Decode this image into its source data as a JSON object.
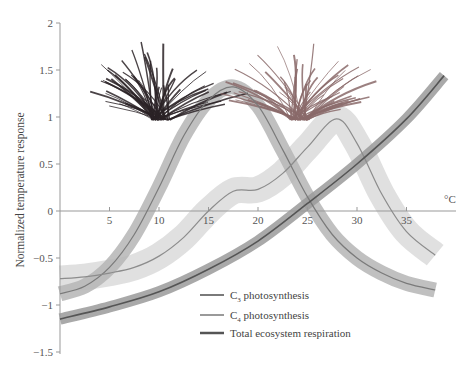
{
  "chart_data": {
    "type": "line",
    "title": "",
    "xlabel": "°C",
    "ylabel": "Normalized temperature response",
    "xlim": [
      0,
      40
    ],
    "ylim": [
      -1.5,
      2
    ],
    "xticks": [
      5,
      10,
      15,
      20,
      25,
      30,
      35
    ],
    "yticks": [
      -1.5,
      -1,
      -0.5,
      0,
      0.5,
      1,
      1.5,
      2
    ],
    "ytick_labels": [
      "−1.5",
      "−1",
      "−0.5",
      "0",
      "0.5",
      "1",
      "1.5",
      "2"
    ],
    "grid": false,
    "legend_position": "lower center",
    "series": [
      {
        "name": "C3 photosynthesis",
        "label_main": "C",
        "label_sub": "3",
        "label_rest": " photosynthesis",
        "color": "#7a7a7a",
        "band_color": "#b5b5b5",
        "band_halfwidth": 0.08,
        "x": [
          0,
          2.5,
          5,
          7.5,
          10,
          12.5,
          15,
          17.5,
          20,
          22.5,
          25,
          27.5,
          30,
          32.5,
          35,
          37.9
        ],
        "y": [
          -0.88,
          -0.8,
          -0.6,
          -0.25,
          0.25,
          0.8,
          1.18,
          1.32,
          1.12,
          0.65,
          0.15,
          -0.25,
          -0.5,
          -0.66,
          -0.77,
          -0.84
        ]
      },
      {
        "name": "C4 photosynthesis",
        "label_main": "C",
        "label_sub": "4",
        "label_rest": " photosynthesis",
        "color": "#8c8c8c",
        "band_color": "#d6d6d6",
        "band_halfwidth": 0.14,
        "x": [
          0,
          2.5,
          5,
          7.5,
          10,
          12.5,
          15,
          17.5,
          20,
          22.5,
          25,
          27.9,
          30,
          32.5,
          35,
          37.9
        ],
        "y": [
          -0.72,
          -0.7,
          -0.66,
          -0.6,
          -0.48,
          -0.28,
          0.0,
          0.21,
          0.23,
          0.4,
          0.68,
          0.98,
          0.72,
          0.18,
          -0.22,
          -0.47
        ]
      },
      {
        "name": "Total ecosystem respiration",
        "label_main": "Total ecosystem respiration",
        "label_sub": "",
        "label_rest": "",
        "color": "#555555",
        "band_color": "#9a9a9a",
        "band_halfwidth": 0.06,
        "x": [
          0,
          5,
          10,
          15,
          20,
          25,
          30,
          35,
          38.8
        ],
        "y": [
          -1.15,
          -1.02,
          -0.86,
          -0.62,
          -0.32,
          0.08,
          0.5,
          0.98,
          1.44
        ]
      }
    ],
    "annotations": [
      "C3 grass illustration (dark)",
      "C4 grass illustration (reddish)"
    ]
  }
}
